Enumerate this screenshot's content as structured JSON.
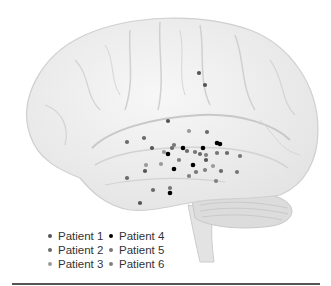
{
  "figure": {
    "type": "brain-lateral-view-electrode-map",
    "colors": {
      "brain_fill": "#f1f1f1",
      "brain_sulcus": "#cfcfcf",
      "cerebellum": "#dadada"
    }
  },
  "legend": {
    "items": [
      {
        "label": "Patient 1",
        "color": "#555555"
      },
      {
        "label": "Patient 2",
        "color": "#6a6a6a"
      },
      {
        "label": "Patient 3",
        "color": "#9a9a9a"
      },
      {
        "label": "Patient 4",
        "color": "#000000"
      },
      {
        "label": "Patient 5",
        "color": "#777777"
      },
      {
        "label": "Patient 6",
        "color": "#808080"
      }
    ]
  },
  "electrodes": [
    {
      "x": 199,
      "y": 73,
      "patient": 1
    },
    {
      "x": 205,
      "y": 85,
      "patient": 1
    },
    {
      "x": 168,
      "y": 121,
      "patient": 1
    },
    {
      "x": 189,
      "y": 131,
      "patient": 3
    },
    {
      "x": 207,
      "y": 132,
      "patient": 2
    },
    {
      "x": 127,
      "y": 142,
      "patient": 2
    },
    {
      "x": 144,
      "y": 138,
      "patient": 2
    },
    {
      "x": 152,
      "y": 148,
      "patient": 1
    },
    {
      "x": 164,
      "y": 152,
      "patient": 3
    },
    {
      "x": 168,
      "y": 154,
      "patient": 4
    },
    {
      "x": 172,
      "y": 148,
      "patient": 2
    },
    {
      "x": 174,
      "y": 145,
      "patient": 5
    },
    {
      "x": 183,
      "y": 148,
      "patient": 4
    },
    {
      "x": 187,
      "y": 151,
      "patient": 2
    },
    {
      "x": 195,
      "y": 152,
      "patient": 5
    },
    {
      "x": 203,
      "y": 148,
      "patient": 4
    },
    {
      "x": 200,
      "y": 154,
      "patient": 2
    },
    {
      "x": 206,
      "y": 155,
      "patient": 6
    },
    {
      "x": 217,
      "y": 143,
      "patient": 4
    },
    {
      "x": 220,
      "y": 144,
      "patient": 4
    },
    {
      "x": 206,
      "y": 160,
      "patient": 1
    },
    {
      "x": 217,
      "y": 153,
      "patient": 5
    },
    {
      "x": 227,
      "y": 153,
      "patient": 2
    },
    {
      "x": 240,
      "y": 156,
      "patient": 5
    },
    {
      "x": 161,
      "y": 164,
      "patient": 3
    },
    {
      "x": 179,
      "y": 160,
      "patient": 6
    },
    {
      "x": 174,
      "y": 169,
      "patient": 4
    },
    {
      "x": 193,
      "y": 165,
      "patient": 4
    },
    {
      "x": 196,
      "y": 172,
      "patient": 5
    },
    {
      "x": 205,
      "y": 170,
      "patient": 6
    },
    {
      "x": 213,
      "y": 166,
      "patient": 3
    },
    {
      "x": 221,
      "y": 171,
      "patient": 2
    },
    {
      "x": 237,
      "y": 172,
      "patient": 5
    },
    {
      "x": 189,
      "y": 176,
      "patient": 6
    },
    {
      "x": 216,
      "y": 181,
      "patient": 6
    },
    {
      "x": 145,
      "y": 171,
      "patient": 1
    },
    {
      "x": 146,
      "y": 165,
      "patient": 3
    },
    {
      "x": 127,
      "y": 178,
      "patient": 2
    },
    {
      "x": 153,
      "y": 190,
      "patient": 2
    },
    {
      "x": 170,
      "y": 188,
      "patient": 5
    },
    {
      "x": 170,
      "y": 193,
      "patient": 4
    },
    {
      "x": 140,
      "y": 203,
      "patient": 1
    }
  ]
}
